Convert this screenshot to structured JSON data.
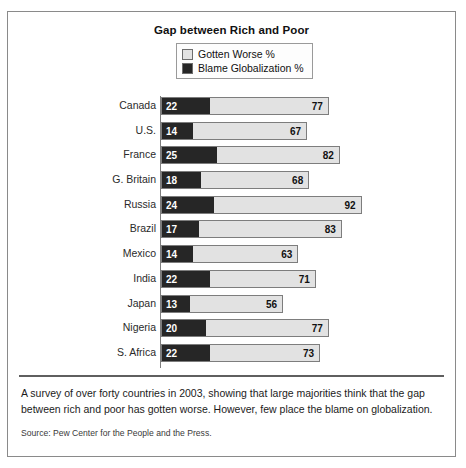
{
  "figure": {
    "title": "Gap between Rich and Poor",
    "caption": "A survey of over forty countries in 2003, showing that large majorities think that the gap between rich and poor has gotten worse. However, few place the blame on globalization.",
    "source": "Source: Pew Center for the People and the Press."
  },
  "chart_data": {
    "type": "bar",
    "orientation": "horizontal",
    "stacked": false,
    "title": "Gap between Rich and Poor",
    "xlabel": "",
    "ylabel": "",
    "xlim": [
      0,
      100
    ],
    "grid": false,
    "legend_position": "top-center",
    "categories": [
      "Canada",
      "U.S.",
      "France",
      "G. Britain",
      "Russia",
      "Brazil",
      "Mexico",
      "India",
      "Japan",
      "Nigeria",
      "S. Africa"
    ],
    "series": [
      {
        "name": "Blame Globalization %",
        "color": "#262626",
        "values": [
          22,
          14,
          25,
          18,
          24,
          17,
          14,
          22,
          13,
          20,
          22
        ]
      },
      {
        "name": "Gotten Worse %",
        "color": "#e2e2e2",
        "values": [
          77,
          67,
          82,
          68,
          92,
          83,
          63,
          71,
          56,
          77,
          73
        ]
      }
    ],
    "rows": [
      {
        "label": "Canada",
        "blame": 22,
        "worse": 77
      },
      {
        "label": "U.S.",
        "blame": 14,
        "worse": 67
      },
      {
        "label": "France",
        "blame": 25,
        "worse": 82
      },
      {
        "label": "G. Britain",
        "blame": 18,
        "worse": 68
      },
      {
        "label": "Russia",
        "blame": 24,
        "worse": 92
      },
      {
        "label": "Brazil",
        "blame": 17,
        "worse": 83
      },
      {
        "label": "Mexico",
        "blame": 14,
        "worse": 63
      },
      {
        "label": "India",
        "blame": 22,
        "worse": 71
      },
      {
        "label": "Japan",
        "blame": 13,
        "worse": 56
      },
      {
        "label": "Nigeria",
        "blame": 20,
        "worse": 77
      },
      {
        "label": "S. Africa",
        "blame": 22,
        "worse": 73
      }
    ]
  },
  "legend": {
    "items": [
      {
        "label": "Gotten Worse %",
        "color": "#e2e2e2"
      },
      {
        "label": "Blame Globalization %",
        "color": "#262626"
      }
    ]
  }
}
